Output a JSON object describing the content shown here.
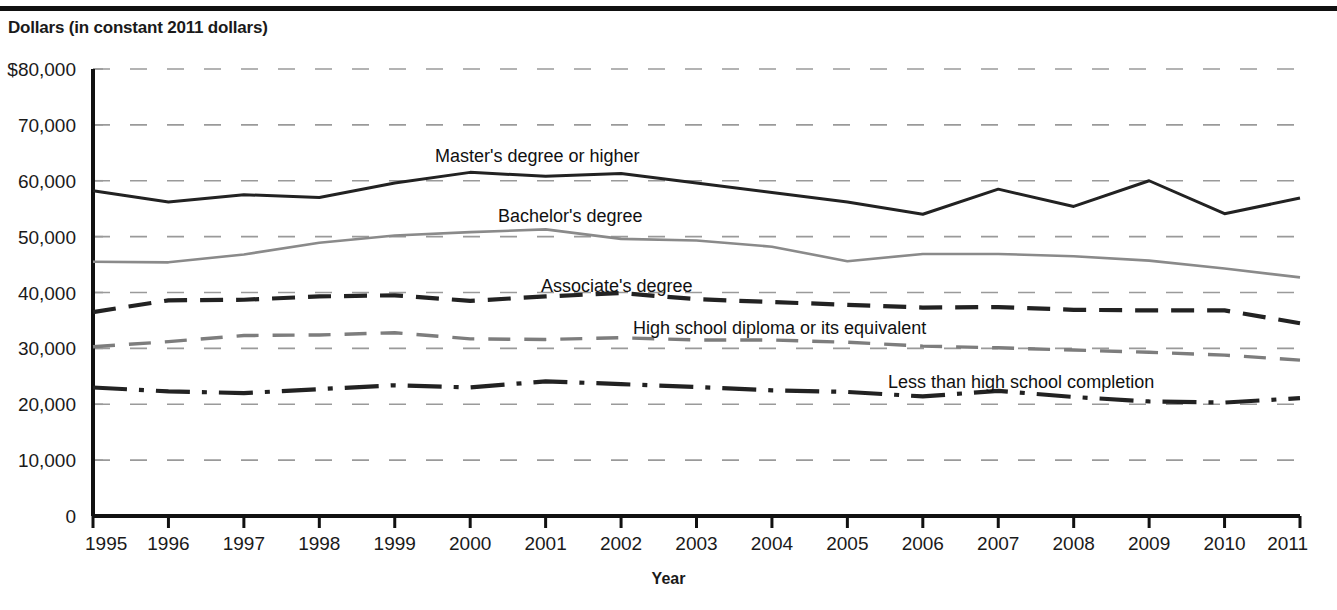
{
  "header": {
    "y_axis_title": "Dollars (in constant 2011 dollars)",
    "x_axis_title": "Year"
  },
  "axes": {
    "y_ticks": [
      "$80,000",
      "70,000",
      "60,000",
      "50,000",
      "40,000",
      "30,000",
      "20,000",
      "10,000",
      "0"
    ],
    "x_ticks": [
      "1995",
      "1996",
      "1997",
      "1998",
      "1999",
      "2000",
      "2001",
      "2002",
      "2003",
      "2004",
      "2005",
      "2006",
      "2007",
      "2008",
      "2009",
      "2010",
      "2011"
    ]
  },
  "series_labels": {
    "masters": "Master's degree or higher",
    "bachelors": "Bachelor's degree",
    "associates": "Associate's degree",
    "highschool": "High school diploma or its equivalent",
    "lessthanhs": "Less than high school completion"
  },
  "colors": {
    "line_dark": "#222222",
    "line_gray": "#8a8a8a",
    "grid": "#9a9a9a",
    "axis": "#111111",
    "background": "#ffffff"
  },
  "chart_data": {
    "type": "line",
    "title": "",
    "subtitle": "",
    "xlabel": "Year",
    "ylabel": "Dollars (in constant 2011 dollars)",
    "xlim": [
      1995,
      2011
    ],
    "ylim": [
      0,
      80000
    ],
    "ytick_values": [
      80000,
      70000,
      60000,
      50000,
      40000,
      30000,
      20000,
      10000,
      0
    ],
    "grid": "horizontal-dashed",
    "legend": "inline-labels",
    "x": [
      1995,
      1996,
      1997,
      1998,
      1999,
      2000,
      2001,
      2002,
      2003,
      2004,
      2005,
      2006,
      2007,
      2008,
      2009,
      2010,
      2011
    ],
    "series": [
      {
        "name": "Master's degree or higher",
        "style": "solid",
        "color": "#222222",
        "values": [
          58200,
          56200,
          57500,
          57000,
          59600,
          61500,
          60800,
          61300,
          59600,
          57900,
          56200,
          54000,
          58500,
          55400,
          60000,
          54100,
          56900
        ]
      },
      {
        "name": "Bachelor's degree",
        "style": "solid-light",
        "color": "#8a8a8a",
        "values": [
          45500,
          45400,
          46800,
          48900,
          50200,
          50800,
          51300,
          49600,
          49300,
          48200,
          45600,
          46900,
          46900,
          46500,
          45700,
          44300,
          42700
        ]
      },
      {
        "name": "Associate's degree",
        "style": "dashed",
        "color": "#222222",
        "values": [
          36500,
          38600,
          38700,
          39300,
          39500,
          38500,
          39300,
          39900,
          38800,
          38300,
          37800,
          37300,
          37400,
          36900,
          36800,
          36800,
          34500
        ]
      },
      {
        "name": "High school diploma or its equivalent",
        "style": "dashed-light",
        "color": "#7d7d7d",
        "values": [
          30300,
          31200,
          32300,
          32400,
          32800,
          31700,
          31600,
          31900,
          31500,
          31500,
          31100,
          30400,
          30100,
          29700,
          29300,
          28800,
          27900
        ]
      },
      {
        "name": "Less than high school completion",
        "style": "dash-dot",
        "color": "#222222",
        "values": [
          23000,
          22300,
          22000,
          22700,
          23400,
          23000,
          24100,
          23600,
          23100,
          22500,
          22200,
          21400,
          22400,
          21300,
          20500,
          20300,
          21100
        ]
      }
    ]
  }
}
